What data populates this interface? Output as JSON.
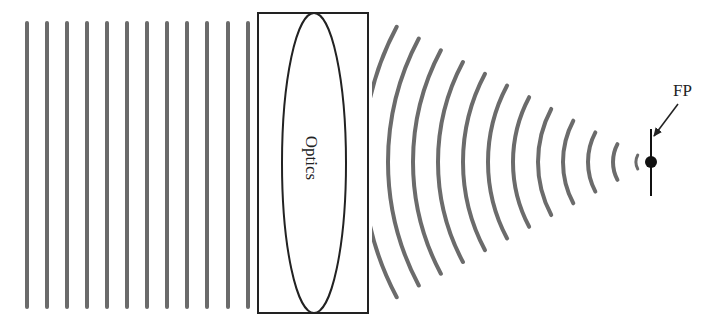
{
  "diagram": {
    "width": 711,
    "height": 332,
    "colors": {
      "wave": "#6b6b6b",
      "outline": "#222222",
      "background": "#ffffff"
    },
    "plane_waves": {
      "count": 12,
      "x_positions": [
        27,
        47,
        67,
        87,
        107,
        127,
        147,
        167,
        187,
        207,
        228,
        248
      ],
      "y_top": 23,
      "y_bottom": 307,
      "stroke_width": 4
    },
    "optics_box": {
      "x": 258,
      "y": 13,
      "width": 110,
      "height": 300,
      "label": "Optics",
      "lens": {
        "cx": 314,
        "cy": 163,
        "rx": 32,
        "ry": 150
      }
    },
    "converging_waves": {
      "center": {
        "x": 651,
        "y": 162
      },
      "radii": [
        288,
        263,
        238,
        213,
        188,
        163,
        138,
        113,
        88,
        63,
        38,
        15
      ],
      "half_angle_deg": 28,
      "clip_min_x": 372,
      "stroke_width": 4
    },
    "focal_point": {
      "label": "FP",
      "dot": {
        "x": 651,
        "y": 162,
        "r": 6
      },
      "line": {
        "x": 651,
        "y1": 129,
        "y2": 196
      },
      "label_pos": {
        "x": 673,
        "y": 96
      },
      "arrow": {
        "x1": 678,
        "y1": 104,
        "x2": 654,
        "y2": 136
      }
    }
  }
}
